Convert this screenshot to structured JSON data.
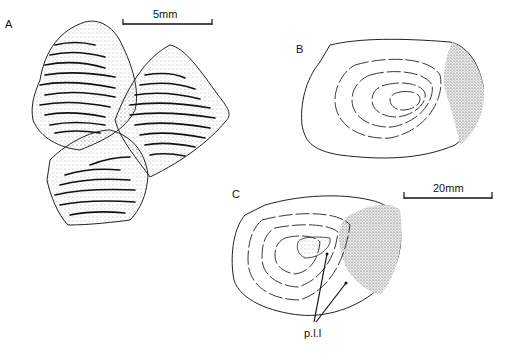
{
  "figure": {
    "panels": [
      {
        "label": "A",
        "description": "three overlapping scales with ctenii (spinules)"
      },
      {
        "label": "B",
        "description": "scale with concentric circuli and tuberculate posterior field"
      },
      {
        "label": "C",
        "description": "scale with circuli, posterior field, and lateral line pores"
      }
    ],
    "scale_bars": [
      {
        "label": "5mm",
        "panel": "A"
      },
      {
        "label": "20mm",
        "panel": "B-C"
      }
    ],
    "annotation": {
      "label": "p.l.l"
    }
  }
}
